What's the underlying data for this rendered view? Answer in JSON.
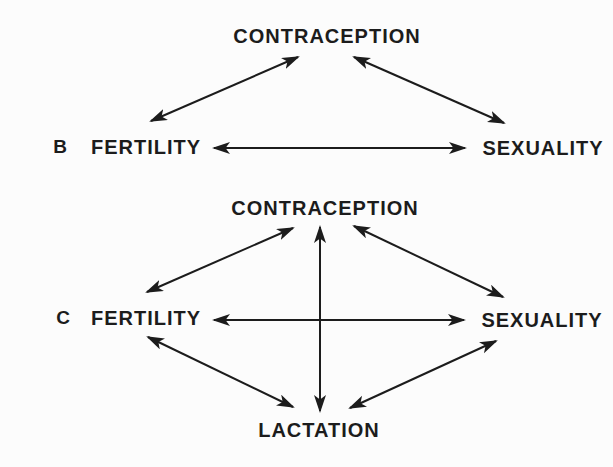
{
  "figure": {
    "type": "relationship-diagram",
    "colors": {
      "ink": "#1c1c1c",
      "paper": "#fcfcfc"
    },
    "panels": [
      {
        "label": "B",
        "nodes": {
          "contraception": "CONTRACEPTION",
          "fertility": "FERTILITY",
          "sexuality": "SEXUALITY"
        },
        "edges": [
          {
            "from": "FERTILITY",
            "to": "CONTRACEPTION",
            "bidirectional": true
          },
          {
            "from": "CONTRACEPTION",
            "to": "SEXUALITY",
            "bidirectional": true
          },
          {
            "from": "FERTILITY",
            "to": "SEXUALITY",
            "bidirectional": true
          }
        ]
      },
      {
        "label": "C",
        "nodes": {
          "contraception": "CONTRACEPTION",
          "fertility": "FERTILITY",
          "sexuality": "SEXUALITY",
          "lactation": "LACTATION"
        },
        "edges": [
          {
            "from": "FERTILITY",
            "to": "CONTRACEPTION",
            "bidirectional": true
          },
          {
            "from": "CONTRACEPTION",
            "to": "SEXUALITY",
            "bidirectional": true
          },
          {
            "from": "FERTILITY",
            "to": "SEXUALITY",
            "bidirectional": true
          },
          {
            "from": "FERTILITY",
            "to": "LACTATION",
            "bidirectional": true
          },
          {
            "from": "SEXUALITY",
            "to": "LACTATION",
            "bidirectional": true
          },
          {
            "from": "CONTRACEPTION",
            "to": "LACTATION",
            "bidirectional": true
          }
        ]
      }
    ]
  }
}
